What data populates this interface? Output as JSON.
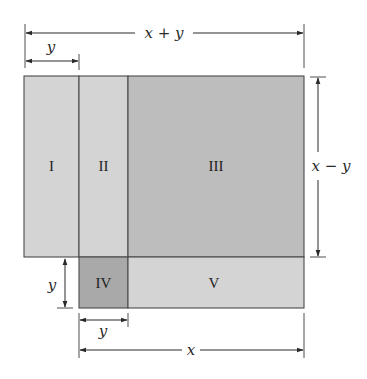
{
  "diagram": {
    "title": "",
    "regions": [
      {
        "id": "I",
        "label": "I",
        "color": "#d4d4d4"
      },
      {
        "id": "II",
        "label": "II",
        "color": "#d4d4d4"
      },
      {
        "id": "III",
        "label": "III",
        "color": "#bdbdbd"
      },
      {
        "id": "IV",
        "label": "IV",
        "color": "#a9a9a9"
      },
      {
        "id": "V",
        "label": "V",
        "color": "#d4d4d4"
      }
    ],
    "dimensions": {
      "top_total": "x + y",
      "top_left": "y",
      "right_height": "x − y",
      "left_small": "y",
      "bottom_small": "y",
      "bottom_total": "x"
    }
  }
}
